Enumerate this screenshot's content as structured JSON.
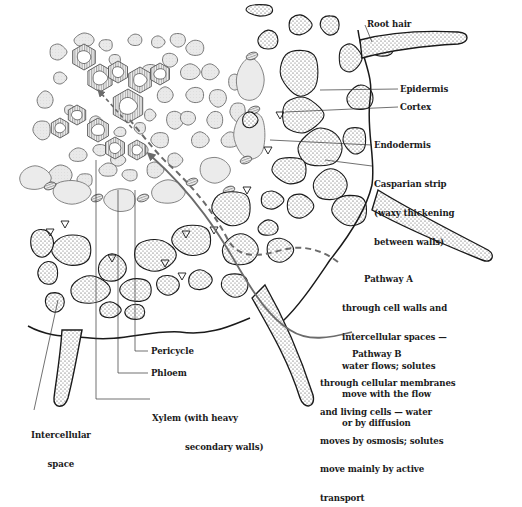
{
  "figure": {
    "colors": {
      "ink": "#1a1a1a",
      "arrow": "#6b6b6b",
      "stele_fill": "#e6e6e6",
      "xylem_wall": "#8a8a8a",
      "cortex_dots": "#333333",
      "background": "#ffffff"
    }
  },
  "labels": {
    "root_hair": "Root hair",
    "epidermis": "Epidermis",
    "cortex": "Cortex",
    "endodermis": "Endodermis",
    "casparian": [
      "Casparian strip",
      "(waxy thickening",
      "between walls)"
    ],
    "pathway_a": {
      "title": "Pathway A",
      "lines": [
        "through cell walls and",
        "intercellular spaces —",
        "water flows; solutes",
        "move with the flow",
        "or by diffusion"
      ]
    },
    "pathway_b": {
      "title": "Pathway B",
      "lines": [
        "through cellular membranes",
        "and living cells — water",
        "moves by osmosis; solutes",
        "move mainly by active",
        "transport"
      ]
    },
    "pericycle": "Pericycle",
    "phloem": "Phloem",
    "xylem": [
      "Xylem (with heavy",
      "secondary walls)"
    ],
    "intercellular": [
      "Intercellular",
      "space"
    ]
  },
  "pathways": [
    {
      "name": "Pathway A",
      "style": "dashed"
    },
    {
      "name": "Pathway B",
      "style": "solid"
    }
  ]
}
